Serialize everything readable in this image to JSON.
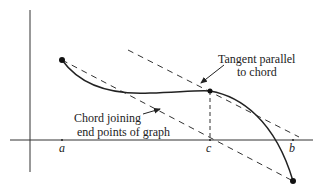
{
  "diagram": {
    "labels": {
      "tangent_line1": "Tangent parallel",
      "tangent_line2": "to chord",
      "chord_line1": "Chord joining",
      "chord_line2": "end points of graph",
      "a": "a",
      "b": "b",
      "c": "c"
    },
    "colors": {
      "ink": "#222222",
      "background": "#ffffff"
    }
  }
}
